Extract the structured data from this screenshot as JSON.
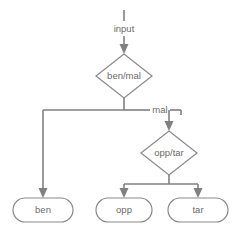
{
  "diagram": {
    "background_color": "#ffffff",
    "line_color": "#808080",
    "node_border_color": "#8a8a8a",
    "node_fill_color": "#ffffff",
    "text_color": "#6b6b6b",
    "entry": {
      "label": "input"
    },
    "decisions": [
      {
        "id": "ben-mal",
        "label": "ben/mal",
        "shape": "diamond",
        "cx": 124,
        "cy": 76,
        "rx": 28,
        "ry": 22
      },
      {
        "id": "opp-tar",
        "label": "opp/tar",
        "shape": "diamond",
        "cx": 169,
        "cy": 153,
        "rx": 28,
        "ry": 22
      }
    ],
    "terminals": [
      {
        "id": "ben",
        "label": "ben",
        "shape": "stadium",
        "x": 13,
        "y": 198,
        "w": 60,
        "h": 24
      },
      {
        "id": "opp",
        "label": "opp",
        "shape": "stadium",
        "x": 96,
        "y": 198,
        "w": 56,
        "h": 24
      },
      {
        "id": "tar",
        "label": "tar",
        "shape": "stadium",
        "x": 168,
        "y": 198,
        "w": 60,
        "h": 24
      }
    ],
    "edge_labels": [
      {
        "id": "mal-branch",
        "label": "mal",
        "x": 160,
        "y": 110
      }
    ],
    "edges": [
      {
        "from": "input",
        "to": "ben-mal",
        "label": "input"
      },
      {
        "from": "ben-mal",
        "to": "ben",
        "label": ""
      },
      {
        "from": "ben-mal",
        "to": "opp-tar",
        "label": "mal"
      },
      {
        "from": "opp-tar",
        "to": "opp",
        "label": ""
      },
      {
        "from": "opp-tar",
        "to": "tar",
        "label": ""
      }
    ]
  }
}
